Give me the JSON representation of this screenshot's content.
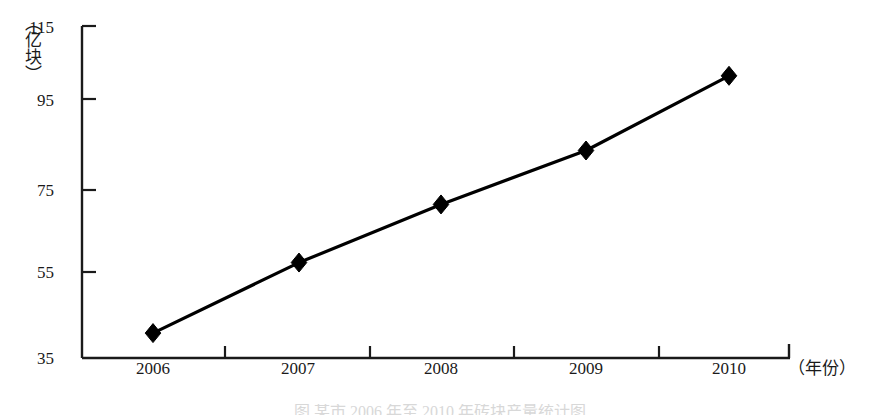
{
  "chart_data": {
    "type": "line",
    "title": "",
    "subtitle": "",
    "xlabel": "（年份）",
    "ylabel": "（亿块）",
    "categories": [
      "2006",
      "2007",
      "2008",
      "2009",
      "2010"
    ],
    "values": [
      41,
      58,
      72,
      85,
      103
    ],
    "series": [
      {
        "name": "",
        "values": [
          41,
          58,
          72,
          85,
          103
        ]
      }
    ],
    "ylim": [
      35,
      115
    ],
    "yticks": [
      35,
      55,
      75,
      95,
      115
    ],
    "ytick_labels": [
      "35",
      "55",
      "75",
      "95",
      "115"
    ],
    "xtick_labels": [
      "2006",
      "2007",
      "2008",
      "2009",
      "2010"
    ],
    "grid": false,
    "legend": false,
    "legend_position": "none",
    "marker": "diamond",
    "line_color": "#000000",
    "marker_color": "#000000",
    "axis_color": "#1a1a1a"
  },
  "axes": {
    "y_unit_label": "（亿块）",
    "x_unit_label": "（年份）"
  },
  "caption": {
    "cut_off_text": "图 某市 2006 年至 2010 年砖块产量统计图"
  }
}
